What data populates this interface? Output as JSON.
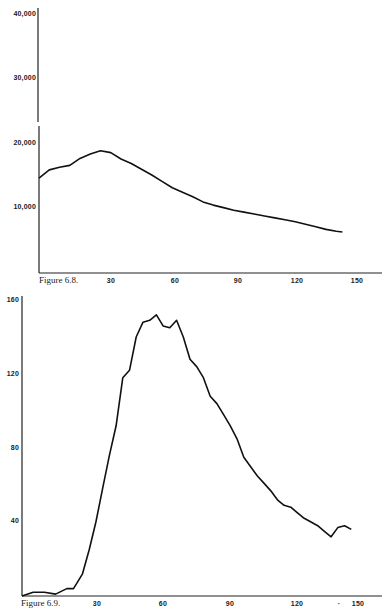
{
  "chart_data": [
    {
      "type": "line",
      "title": "Figure 6.8.",
      "caption": "Figure 6.8.",
      "xlabel": "",
      "ylabel": "",
      "x_ticks": [
        "30",
        "60",
        "90",
        "120",
        "150"
      ],
      "y_ticks": [
        "10,000",
        "20,000",
        "30,000",
        "40,000"
      ],
      "ylim": [
        0,
        40000
      ],
      "xlim": [
        0,
        160
      ],
      "axis_break": "between 20,000 and 30,000 on y axis",
      "grid": false,
      "series": [
        {
          "name": "Figure 6.8 curve",
          "x": [
            0,
            5,
            10,
            15,
            20,
            25,
            30,
            35,
            40,
            45,
            50,
            55,
            60,
            65,
            70,
            75,
            80,
            85,
            90,
            95,
            100,
            105,
            110,
            115,
            120,
            125,
            130,
            135,
            140,
            145,
            148
          ],
          "values": [
            14500,
            15800,
            16200,
            16500,
            17600,
            18300,
            18800,
            18500,
            17500,
            16800,
            15900,
            15000,
            14000,
            13000,
            12300,
            11600,
            10800,
            10300,
            9900,
            9500,
            9200,
            8900,
            8600,
            8300,
            8000,
            7700,
            7300,
            6900,
            6500,
            6200,
            6100
          ]
        }
      ]
    },
    {
      "type": "line",
      "title": "Figure 6.9.",
      "caption": "Figure 6.9.",
      "xlabel": "",
      "ylabel": "",
      "x_ticks": [
        "30",
        "60",
        "90",
        "120",
        "150"
      ],
      "y_ticks": [
        "40",
        "80",
        "120",
        "160"
      ],
      "ylim": [
        0,
        160
      ],
      "xlim": [
        0,
        160
      ],
      "grid": false,
      "series": [
        {
          "name": "Figure 6.9 curve",
          "x": [
            0,
            5,
            10,
            15,
            20,
            23,
            27,
            30,
            33,
            36,
            39,
            42,
            45,
            48,
            51,
            54,
            57,
            60,
            63,
            66,
            69,
            72,
            75,
            78,
            81,
            84,
            87,
            90,
            93,
            96,
            99,
            102,
            105,
            108,
            111,
            114,
            117,
            120,
            123,
            126,
            129,
            132,
            135,
            138,
            141,
            144,
            147
          ],
          "values": [
            0,
            2,
            2,
            1,
            4,
            4,
            12,
            25,
            40,
            58,
            76,
            92,
            118,
            122,
            140,
            148,
            149,
            152,
            146,
            145,
            149,
            140,
            128,
            124,
            118,
            108,
            104,
            98,
            92,
            85,
            75,
            70,
            65,
            61,
            57,
            52,
            49,
            48,
            45,
            42,
            40,
            38,
            35,
            32,
            37,
            38,
            36
          ]
        }
      ]
    }
  ],
  "figures": {
    "top": {
      "caption": "Figure 6.8.",
      "y_labels": [
        "40,000",
        "30,000",
        "20,000",
        "10,000"
      ],
      "x_labels": [
        "30",
        "60",
        "90",
        "120",
        "150"
      ]
    },
    "bottom": {
      "caption": "Figure 6.9.",
      "y_labels": [
        "160",
        "120",
        "80",
        "40"
      ],
      "x_labels": [
        "30",
        "60",
        "90",
        "120",
        "150"
      ],
      "stray_mark": "·"
    }
  }
}
